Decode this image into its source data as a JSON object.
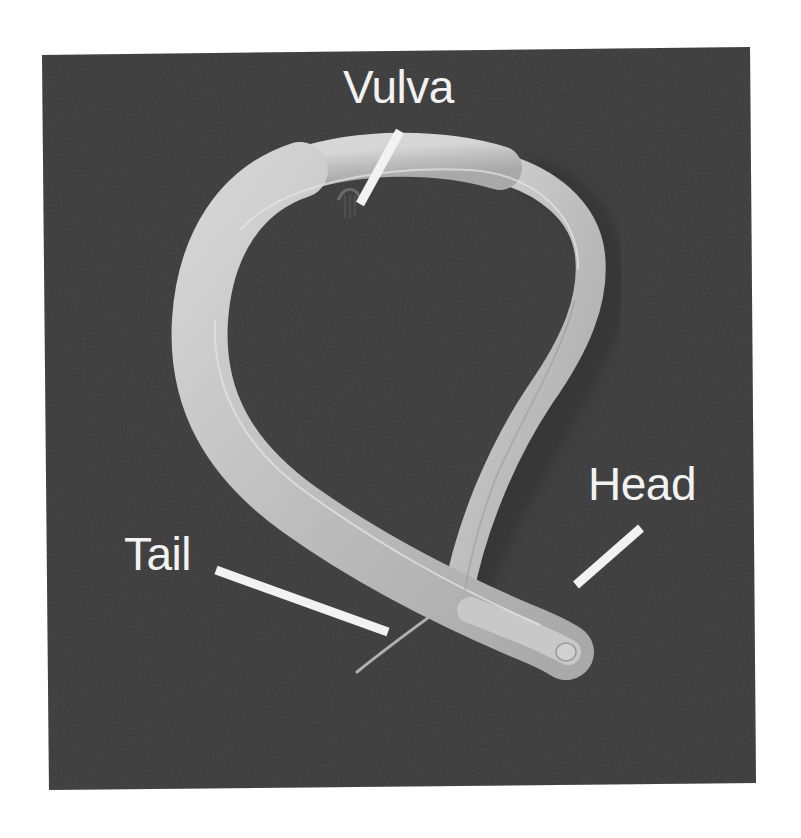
{
  "figure": {
    "background_color": "#4a4a4a",
    "page_color": "#ffffff",
    "body_color": "#c4c4c4",
    "pointer_color": "#f2f2f2"
  },
  "labels": {
    "vulva": "Vulva",
    "head": "Head",
    "tail": "Tail"
  }
}
